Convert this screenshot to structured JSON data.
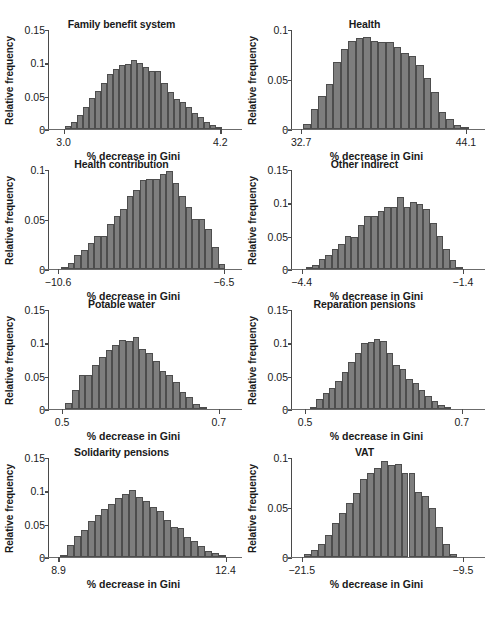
{
  "figure": {
    "panel_count": 8,
    "y_axis_label": "Relative frequency",
    "x_axis_label": "% decrease in Gini"
  },
  "chart_data": [
    {
      "type": "bar",
      "title": "Family benefit system",
      "xlabel": "% decrease in Gini",
      "ylabel": "Relative frequency",
      "xticklabels": [
        "3.0",
        "4.2"
      ],
      "xlim": [
        2.88,
        4.32
      ],
      "xticks": [
        3.0,
        4.2
      ],
      "ylim": [
        0,
        0.15
      ],
      "yticks": [
        0,
        0.05,
        0.1,
        0.15
      ],
      "yticklabels": [
        "0",
        "0.05",
        "0.1",
        "0.15"
      ],
      "grid": false,
      "legend": "none",
      "values": [
        0.004,
        0.01,
        0.02,
        0.033,
        0.046,
        0.056,
        0.069,
        0.082,
        0.09,
        0.095,
        0.097,
        0.103,
        0.098,
        0.092,
        0.086,
        0.087,
        0.069,
        0.055,
        0.045,
        0.04,
        0.032,
        0.023,
        0.017,
        0.01,
        0.006,
        0.003
      ],
      "bin_start": 3.01,
      "bin_width": 0.0462
    },
    {
      "type": "bar",
      "title": "Health",
      "xlabel": "% decrease in Gini",
      "ylabel": "Relative frequency",
      "xticklabels": [
        "32.7",
        "44.1"
      ],
      "xlim": [
        32.0,
        45.0
      ],
      "xticks": [
        32.7,
        44.1
      ],
      "ylim": [
        0,
        0.1
      ],
      "yticks": [
        0,
        0.05,
        0.1
      ],
      "yticklabels": [
        "0",
        "0.05",
        "0.1"
      ],
      "grid": false,
      "legend": "none",
      "values": [
        0.005,
        0.02,
        0.033,
        0.045,
        0.067,
        0.08,
        0.088,
        0.091,
        0.092,
        0.088,
        0.087,
        0.087,
        0.082,
        0.076,
        0.073,
        0.064,
        0.051,
        0.037,
        0.017,
        0.01,
        0.004,
        0.002
      ],
      "bin_start": 32.85,
      "bin_width": 0.52
    },
    {
      "type": "bar",
      "title": "Health contribution",
      "xlabel": "% decrease in Gini",
      "ylabel": "Relative frequency",
      "xticklabels": [
        "−10.6",
        "−6.5"
      ],
      "xlim": [
        -10.85,
        -6.2
      ],
      "xticks": [
        -10.6,
        -6.5
      ],
      "ylim": [
        0,
        0.1
      ],
      "yticks": [
        0,
        0.05,
        0.1
      ],
      "yticklabels": [
        "0",
        "0.05",
        "0.1"
      ],
      "grid": false,
      "legend": "none",
      "values": [
        0.002,
        0.006,
        0.014,
        0.019,
        0.026,
        0.033,
        0.033,
        0.045,
        0.053,
        0.06,
        0.073,
        0.079,
        0.089,
        0.09,
        0.09,
        0.095,
        0.098,
        0.086,
        0.073,
        0.062,
        0.05,
        0.05,
        0.04,
        0.022,
        0.005
      ],
      "bin_start": -10.52,
      "bin_width": 0.162
    },
    {
      "type": "bar",
      "title": "Other indirect",
      "xlabel": "% decrease in Gini",
      "ylabel": "Relative frequency",
      "xticklabels": [
        "−4.4",
        "−1.4"
      ],
      "xlim": [
        -4.6,
        -1.1
      ],
      "xticks": [
        -4.4,
        -1.4
      ],
      "ylim": [
        0,
        0.15
      ],
      "yticks": [
        0,
        0.05,
        0.1,
        0.15
      ],
      "yticklabels": [
        "0",
        "0.05",
        "0.1",
        "0.15"
      ],
      "grid": false,
      "legend": "none",
      "values": [
        0.003,
        0.006,
        0.014,
        0.021,
        0.029,
        0.037,
        0.049,
        0.048,
        0.066,
        0.079,
        0.079,
        0.086,
        0.093,
        0.092,
        0.107,
        0.092,
        0.1,
        0.097,
        0.09,
        0.069,
        0.049,
        0.029,
        0.013,
        0.003
      ],
      "bin_start": -4.33,
      "bin_width": 0.122
    },
    {
      "type": "bar",
      "title": "Potable water",
      "xlabel": "% decrease in Gini",
      "ylabel": "Relative frequency",
      "xticklabels": [
        "0.5",
        "0.7"
      ],
      "xlim": [
        0.482,
        0.722
      ],
      "xticks": [
        0.5,
        0.7
      ],
      "ylim": [
        0,
        0.15
      ],
      "yticks": [
        0,
        0.05,
        0.1,
        0.15
      ],
      "yticklabels": [
        "0",
        "0.05",
        "0.1",
        "0.15"
      ],
      "grid": false,
      "legend": "none",
      "values": [
        0.009,
        0.028,
        0.05,
        0.05,
        0.065,
        0.077,
        0.088,
        0.096,
        0.103,
        0.102,
        0.107,
        0.089,
        0.083,
        0.071,
        0.056,
        0.05,
        0.04,
        0.025,
        0.017,
        0.007,
        0.003
      ],
      "bin_start": 0.504,
      "bin_width": 0.0086
    },
    {
      "type": "bar",
      "title": "Reparation pensions",
      "xlabel": "% decrease in Gini",
      "ylabel": "Relative frequency",
      "xticklabels": [
        "0.5",
        "0.7"
      ],
      "xlim": [
        0.482,
        0.722
      ],
      "xticks": [
        0.5,
        0.7
      ],
      "ylim": [
        0,
        0.15
      ],
      "yticks": [
        0,
        0.05,
        0.1,
        0.15
      ],
      "yticklabels": [
        "0",
        "0.05",
        "0.1",
        "0.15"
      ],
      "grid": false,
      "legend": "none",
      "values": [
        0.003,
        0.015,
        0.023,
        0.031,
        0.042,
        0.055,
        0.07,
        0.083,
        0.098,
        0.1,
        0.105,
        0.102,
        0.083,
        0.066,
        0.06,
        0.045,
        0.039,
        0.028,
        0.019,
        0.011,
        0.006,
        0.002
      ],
      "bin_start": 0.506,
      "bin_width": 0.0082
    },
    {
      "type": "bar",
      "title": "Solidarity pensions",
      "xlabel": "% decrease in Gini",
      "ylabel": "Relative frequency",
      "xticklabels": [
        "8.9",
        "12.4"
      ],
      "xlim": [
        8.68,
        12.62
      ],
      "xticks": [
        8.9,
        12.4
      ],
      "ylim": [
        0,
        0.15
      ],
      "yticks": [
        0,
        0.05,
        0.1,
        0.15
      ],
      "yticklabels": [
        "0",
        "0.05",
        "0.1",
        "0.15"
      ],
      "grid": false,
      "legend": "none",
      "values": [
        0.003,
        0.018,
        0.031,
        0.04,
        0.054,
        0.063,
        0.071,
        0.079,
        0.088,
        0.094,
        0.1,
        0.09,
        0.084,
        0.074,
        0.069,
        0.055,
        0.045,
        0.043,
        0.029,
        0.024,
        0.016,
        0.009,
        0.006,
        0.002
      ],
      "bin_start": 8.93,
      "bin_width": 0.145
    },
    {
      "type": "bar",
      "title": "VAT",
      "xlabel": "% decrease in Gini",
      "ylabel": "Relative frequency",
      "xticklabels": [
        "−21.5",
        "−9.5"
      ],
      "xlim": [
        -22.3,
        -8.3
      ],
      "xticks": [
        -21.5,
        -9.5
      ],
      "ylim": [
        0,
        0.1
      ],
      "yticks": [
        0,
        0.05,
        0.1
      ],
      "yticklabels": [
        "0",
        "0.05",
        "0.1"
      ],
      "grid": false,
      "legend": "none",
      "values": [
        0.003,
        0.007,
        0.013,
        0.022,
        0.034,
        0.044,
        0.054,
        0.064,
        0.078,
        0.084,
        0.089,
        0.096,
        0.092,
        0.093,
        0.084,
        0.084,
        0.065,
        0.061,
        0.049,
        0.03,
        0.013,
        0.003
      ],
      "bin_start": -21.35,
      "bin_width": 0.52
    }
  ]
}
